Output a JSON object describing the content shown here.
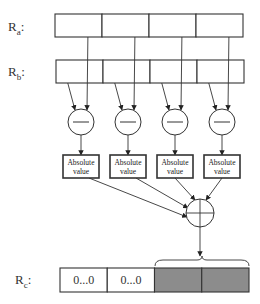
{
  "labels": {
    "ra": {
      "base": "R",
      "sub": "a",
      "suffix": ":"
    },
    "rb": {
      "base": "R",
      "sub": "b",
      "suffix": ":"
    },
    "rc": {
      "base": "R",
      "sub": "c",
      "suffix": ":"
    }
  },
  "registers": {
    "ra": {
      "x": 55,
      "y": 14,
      "w": 188,
      "h": 23,
      "cells": 4
    },
    "rb": {
      "x": 56,
      "y": 60,
      "w": 188,
      "h": 23,
      "cells": 4
    },
    "rc": {
      "x": 60,
      "y": 268,
      "w": 189,
      "h": 24,
      "cells": [
        "0...0",
        "0...0",
        "",
        ""
      ],
      "shaded": [
        false,
        false,
        true,
        true
      ]
    }
  },
  "subtract_nodes": {
    "symbol": "minus",
    "centers_x": [
      81,
      128,
      175,
      222
    ],
    "center_y": 122,
    "radius": 13
  },
  "abs_boxes": {
    "label_line1": "Absolute",
    "label_line2": "value",
    "xs": [
      63,
      110,
      157,
      204
    ],
    "y": 155,
    "w": 36,
    "h": 23
  },
  "sum_node": {
    "symbol": "plus",
    "cx": 200,
    "cy": 213,
    "r": 14
  },
  "brace": {
    "x1": 155,
    "x2": 249,
    "y": 258
  },
  "colors": {
    "stroke": "#333333",
    "shade": "#8c8c8c",
    "bg": "#ffffff"
  }
}
